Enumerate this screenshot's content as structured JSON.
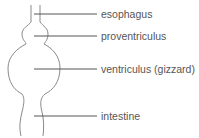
{
  "diagram": {
    "title": "",
    "labels": [
      {
        "text": "esophagus",
        "y": 8
      },
      {
        "text": "proventriculus",
        "y": 30
      },
      {
        "text": "ventriculus (gizzard)",
        "y": 63
      },
      {
        "text": "intestine",
        "y": 110
      }
    ],
    "colors": {
      "outline": "#8a8a8a",
      "leader": "#555555",
      "text": "#555555"
    }
  }
}
